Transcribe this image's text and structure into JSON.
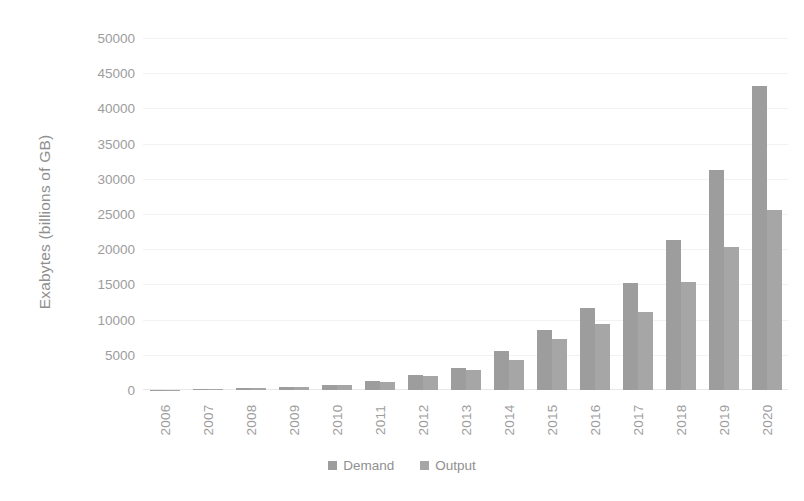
{
  "chart_data": {
    "type": "bar",
    "title": "",
    "xlabel": "",
    "ylabel": "Exabytes (billions of GB)",
    "categories": [
      "2006",
      "2007",
      "2008",
      "2009",
      "2010",
      "2011",
      "2012",
      "2013",
      "2014",
      "2015",
      "2016",
      "2017",
      "2018",
      "2019",
      "2020"
    ],
    "series": [
      {
        "name": "Demand",
        "color": "#9d9d9d",
        "values": [
          60,
          120,
          250,
          450,
          750,
          1250,
          2100,
          3100,
          5500,
          8500,
          11700,
          15200,
          21300,
          31300,
          43200
        ]
      },
      {
        "name": "Output",
        "color": "#a6a6a6",
        "values": [
          55,
          110,
          230,
          420,
          700,
          1150,
          1950,
          2850,
          4300,
          7200,
          9400,
          11100,
          15400,
          20300,
          25500
        ]
      }
    ],
    "ylim": [
      0,
      50000
    ],
    "yticks": [
      0,
      5000,
      10000,
      15000,
      20000,
      25000,
      30000,
      35000,
      40000,
      45000,
      50000
    ],
    "ytick_labels": [
      "0",
      "5000",
      "10000",
      "15000",
      "20000",
      "25000",
      "30000",
      "35000",
      "40000",
      "45000",
      "50000"
    ],
    "grid": true,
    "grid_color": "#f2f2f2",
    "legend_position": "bottom",
    "background": "#ffffff",
    "axis_text_color": "#9d9d9d"
  }
}
